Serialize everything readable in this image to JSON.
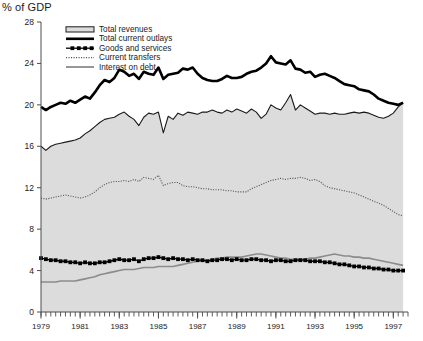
{
  "chart_data": {
    "type": "line",
    "title": "",
    "ylabel": "% of GDP",
    "xlabel": "",
    "ylim": [
      0,
      28
    ],
    "xlim": [
      1979,
      1997.75
    ],
    "grid": false,
    "legend_position": "top-left-inside",
    "y_ticks": [
      0,
      4,
      8,
      12,
      16,
      20,
      24,
      28
    ],
    "x_ticks": [
      1979,
      1981,
      1983,
      1985,
      1987,
      1989,
      1991,
      1993,
      1995,
      1997
    ],
    "x_tick_labels": [
      "1979",
      "1981",
      "1983",
      "1985",
      "1987",
      "1989",
      "1991",
      "1993",
      "1995",
      "1997"
    ],
    "x_minor_tick_interval": 0.25,
    "x_values": [
      1979.0,
      1979.25,
      1979.5,
      1979.75,
      1980.0,
      1980.25,
      1980.5,
      1980.75,
      1981.0,
      1981.25,
      1981.5,
      1981.75,
      1982.0,
      1982.25,
      1982.5,
      1982.75,
      1983.0,
      1983.25,
      1983.5,
      1983.75,
      1984.0,
      1984.25,
      1984.5,
      1984.75,
      1985.0,
      1985.25,
      1985.5,
      1985.75,
      1986.0,
      1986.25,
      1986.5,
      1986.75,
      1987.0,
      1987.25,
      1987.5,
      1987.75,
      1988.0,
      1988.25,
      1988.5,
      1988.75,
      1989.0,
      1989.25,
      1989.5,
      1989.75,
      1990.0,
      1990.25,
      1990.5,
      1990.75,
      1991.0,
      1991.25,
      1991.5,
      1991.75,
      1992.0,
      1992.25,
      1992.5,
      1992.75,
      1993.0,
      1993.25,
      1993.5,
      1993.75,
      1994.0,
      1994.25,
      1994.5,
      1994.75,
      1995.0,
      1995.25,
      1995.5,
      1995.75,
      1996.0,
      1996.25,
      1996.5,
      1996.75,
      1997.0,
      1997.25,
      1997.5
    ],
    "series": [
      {
        "name": "Total revenues",
        "style": "area-outline",
        "color": "#1a1a1a",
        "fill": "#dcdcdc",
        "values": [
          16.0,
          15.6,
          16.0,
          16.2,
          16.3,
          16.4,
          16.5,
          16.6,
          16.8,
          17.2,
          17.5,
          17.9,
          18.3,
          18.6,
          18.7,
          18.8,
          19.1,
          19.3,
          18.9,
          18.6,
          18.0,
          18.8,
          19.2,
          19.1,
          19.3,
          17.3,
          18.9,
          18.6,
          19.2,
          19.0,
          19.3,
          19.2,
          19.1,
          19.3,
          19.3,
          19.5,
          19.3,
          19.2,
          19.5,
          19.3,
          19.6,
          19.4,
          19.2,
          19.6,
          19.3,
          18.7,
          19.1,
          20.0,
          19.7,
          19.5,
          20.2,
          21.0,
          19.5,
          20.0,
          19.7,
          19.4,
          19.1,
          19.2,
          19.2,
          19.1,
          19.2,
          19.1,
          19.1,
          19.2,
          19.3,
          19.2,
          19.3,
          19.2,
          19.0,
          18.8,
          18.7,
          18.9,
          19.2,
          19.8,
          20.2
        ]
      },
      {
        "name": "Total current outlays",
        "style": "thick-solid",
        "color": "#000000",
        "values": [
          19.8,
          19.5,
          19.8,
          20.0,
          20.2,
          20.1,
          20.4,
          20.2,
          20.5,
          20.8,
          20.6,
          21.2,
          21.9,
          22.4,
          22.2,
          22.6,
          23.4,
          23.2,
          22.8,
          23.0,
          22.5,
          23.2,
          23.0,
          22.9,
          23.6,
          22.5,
          22.9,
          23.0,
          23.1,
          23.5,
          23.4,
          23.6,
          23.0,
          22.6,
          22.4,
          22.3,
          22.3,
          22.5,
          22.8,
          22.6,
          22.6,
          22.7,
          23.0,
          23.2,
          23.3,
          23.6,
          24.0,
          24.7,
          24.1,
          24.0,
          23.9,
          24.3,
          23.5,
          23.4,
          23.1,
          23.2,
          22.7,
          22.9,
          23.0,
          22.8,
          22.6,
          22.3,
          22.0,
          21.9,
          21.8,
          21.5,
          21.4,
          21.3,
          21.0,
          20.6,
          20.4,
          20.2,
          20.1,
          20.0,
          20.2
        ]
      },
      {
        "name": "Goods and services",
        "style": "marker-line",
        "color": "#000000",
        "values": [
          5.2,
          5.1,
          5.0,
          5.0,
          4.9,
          4.9,
          4.8,
          4.8,
          4.7,
          4.8,
          4.7,
          4.7,
          4.8,
          4.8,
          4.9,
          5.0,
          5.1,
          5.0,
          5.0,
          5.1,
          4.9,
          5.1,
          5.2,
          5.2,
          5.3,
          5.2,
          5.1,
          5.2,
          5.1,
          5.1,
          5.0,
          5.1,
          5.0,
          5.0,
          4.9,
          5.0,
          5.0,
          5.1,
          5.1,
          5.0,
          5.1,
          5.0,
          5.0,
          5.1,
          5.1,
          5.0,
          5.0,
          4.9,
          5.0,
          5.0,
          4.9,
          4.9,
          5.0,
          5.0,
          5.0,
          4.9,
          4.9,
          4.9,
          4.8,
          4.8,
          4.7,
          4.6,
          4.6,
          4.5,
          4.4,
          4.4,
          4.3,
          4.3,
          4.2,
          4.2,
          4.1,
          4.1,
          4.0,
          4.0,
          4.0
        ]
      },
      {
        "name": "Current transfers",
        "style": "dotted",
        "color": "#555555",
        "values": [
          11.0,
          10.9,
          11.0,
          11.1,
          11.2,
          11.3,
          11.2,
          11.1,
          11.0,
          11.1,
          11.3,
          11.6,
          12.0,
          12.3,
          12.5,
          12.6,
          12.6,
          12.7,
          12.6,
          12.8,
          12.6,
          13.0,
          12.9,
          12.8,
          13.2,
          12.2,
          12.4,
          12.5,
          12.5,
          12.2,
          12.1,
          12.1,
          12.0,
          11.9,
          11.9,
          11.8,
          11.8,
          11.8,
          11.7,
          11.7,
          11.6,
          11.6,
          11.6,
          11.9,
          12.1,
          12.3,
          12.5,
          12.7,
          12.8,
          12.9,
          12.8,
          12.9,
          12.9,
          13.0,
          12.9,
          12.7,
          12.8,
          12.6,
          12.2,
          12.0,
          11.9,
          11.8,
          11.7,
          11.6,
          11.5,
          11.3,
          11.1,
          10.9,
          10.7,
          10.5,
          10.3,
          10.0,
          9.7,
          9.4,
          9.3
        ]
      },
      {
        "name": "Interest on debt",
        "style": "gray-solid",
        "color": "#8c8c8c",
        "values": [
          2.9,
          2.9,
          2.9,
          2.9,
          3.0,
          3.0,
          3.0,
          3.0,
          3.1,
          3.2,
          3.3,
          3.4,
          3.6,
          3.7,
          3.8,
          3.9,
          4.0,
          4.1,
          4.1,
          4.1,
          4.2,
          4.3,
          4.3,
          4.3,
          4.4,
          4.4,
          4.4,
          4.4,
          4.5,
          4.6,
          4.7,
          4.8,
          4.9,
          5.0,
          5.0,
          5.1,
          5.2,
          5.2,
          5.3,
          5.3,
          5.3,
          5.3,
          5.4,
          5.5,
          5.6,
          5.6,
          5.5,
          5.4,
          5.3,
          5.2,
          5.2,
          5.1,
          5.1,
          5.1,
          5.1,
          5.2,
          5.2,
          5.3,
          5.4,
          5.5,
          5.6,
          5.5,
          5.4,
          5.4,
          5.3,
          5.3,
          5.2,
          5.2,
          5.1,
          5.0,
          4.9,
          4.8,
          4.7,
          4.6,
          4.5
        ]
      }
    ]
  },
  "legend": {
    "items": [
      {
        "label": "Total revenues",
        "swatch": "area-swatch"
      },
      {
        "label": "Total current outlays",
        "swatch": "thick-swatch"
      },
      {
        "label": "Goods and services",
        "swatch": "marker-swatch"
      },
      {
        "label": "Current transfers",
        "swatch": "dotted-swatch"
      },
      {
        "label": "Interest on debt",
        "swatch": "gray-swatch"
      }
    ]
  },
  "colors": {
    "plot_fill": "#dcdcdc",
    "outlays_line": "#000000",
    "revenues_line": "#1a1a1a",
    "transfers_line": "#555555",
    "interest_line": "#8c8c8c",
    "axis": "#4d4d4d",
    "text": "#1a1a1a",
    "background": "#ffffff"
  }
}
